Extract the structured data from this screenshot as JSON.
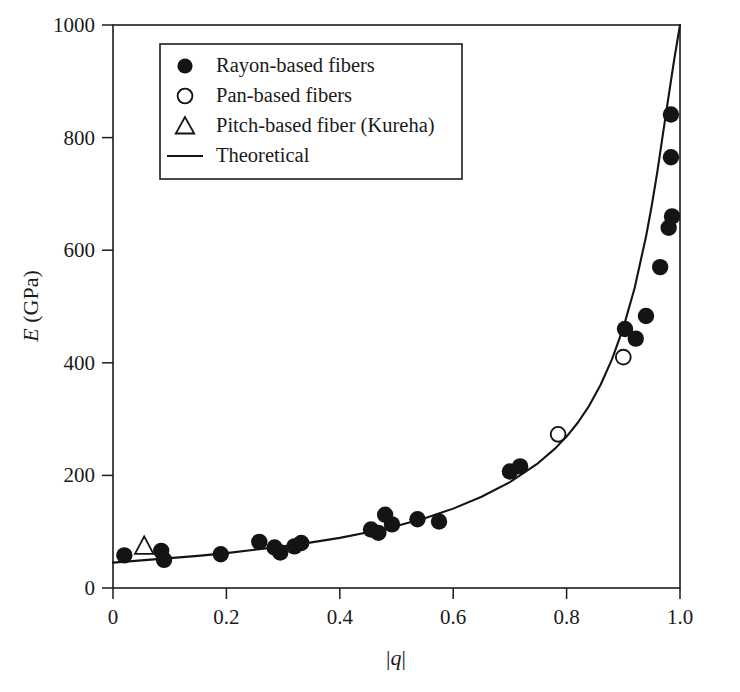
{
  "chart_data": {
    "type": "scatter",
    "title": "",
    "xlabel": "|q|",
    "ylabel": "E (GPa)",
    "xlim": [
      0,
      1.0
    ],
    "ylim": [
      0,
      1000
    ],
    "xticks": [
      0,
      0.2,
      0.4,
      0.6,
      0.8,
      1.0
    ],
    "xticklabels": [
      "0",
      "0.2",
      "0.4",
      "0.6",
      "0.8",
      "1.0"
    ],
    "yticks": [
      0,
      200,
      400,
      600,
      800,
      1000
    ],
    "yticklabels": [
      "0",
      "200",
      "400",
      "600",
      "800",
      "1000"
    ],
    "grid": false,
    "legend_position": "upper-left",
    "series": [
      {
        "name": "Rayon-based fibers",
        "marker": "filled-circle",
        "color": "#141414",
        "points": [
          {
            "x": 0.02,
            "y": 58
          },
          {
            "x": 0.085,
            "y": 66
          },
          {
            "x": 0.09,
            "y": 50
          },
          {
            "x": 0.19,
            "y": 60
          },
          {
            "x": 0.258,
            "y": 82
          },
          {
            "x": 0.285,
            "y": 72
          },
          {
            "x": 0.295,
            "y": 63
          },
          {
            "x": 0.32,
            "y": 74
          },
          {
            "x": 0.332,
            "y": 80
          },
          {
            "x": 0.455,
            "y": 104
          },
          {
            "x": 0.468,
            "y": 98
          },
          {
            "x": 0.48,
            "y": 130
          },
          {
            "x": 0.492,
            "y": 113
          },
          {
            "x": 0.537,
            "y": 122
          },
          {
            "x": 0.575,
            "y": 118
          },
          {
            "x": 0.7,
            "y": 207
          },
          {
            "x": 0.718,
            "y": 216
          },
          {
            "x": 0.903,
            "y": 460
          },
          {
            "x": 0.922,
            "y": 443
          },
          {
            "x": 0.94,
            "y": 483
          },
          {
            "x": 0.965,
            "y": 570
          },
          {
            "x": 0.98,
            "y": 640
          },
          {
            "x": 0.986,
            "y": 660
          },
          {
            "x": 0.984,
            "y": 765
          },
          {
            "x": 0.984,
            "y": 841
          }
        ]
      },
      {
        "name": "Pan-based fibers",
        "marker": "open-circle",
        "color": "#141414",
        "points": [
          {
            "x": 0.785,
            "y": 273
          },
          {
            "x": 0.9,
            "y": 410
          }
        ]
      },
      {
        "name": "Pitch-based fiber (Kureha)",
        "marker": "open-triangle",
        "color": "#141414",
        "points": [
          {
            "x": 0.055,
            "y": 74
          }
        ]
      },
      {
        "name": "Theoretical",
        "marker": "line",
        "color": "#141414",
        "curve": [
          {
            "x": 0.0,
            "y": 45
          },
          {
            "x": 0.05,
            "y": 49
          },
          {
            "x": 0.1,
            "y": 53
          },
          {
            "x": 0.15,
            "y": 57
          },
          {
            "x": 0.2,
            "y": 62
          },
          {
            "x": 0.25,
            "y": 68
          },
          {
            "x": 0.3,
            "y": 74
          },
          {
            "x": 0.35,
            "y": 81
          },
          {
            "x": 0.4,
            "y": 89
          },
          {
            "x": 0.45,
            "y": 99
          },
          {
            "x": 0.5,
            "y": 110
          },
          {
            "x": 0.55,
            "y": 124
          },
          {
            "x": 0.6,
            "y": 141
          },
          {
            "x": 0.65,
            "y": 162
          },
          {
            "x": 0.7,
            "y": 188
          },
          {
            "x": 0.75,
            "y": 222
          },
          {
            "x": 0.78,
            "y": 248
          },
          {
            "x": 0.8,
            "y": 269
          },
          {
            "x": 0.82,
            "y": 294
          },
          {
            "x": 0.84,
            "y": 324
          },
          {
            "x": 0.86,
            "y": 361
          },
          {
            "x": 0.88,
            "y": 406
          },
          {
            "x": 0.9,
            "y": 462
          },
          {
            "x": 0.92,
            "y": 533
          },
          {
            "x": 0.94,
            "y": 624
          },
          {
            "x": 0.95,
            "y": 678
          },
          {
            "x": 0.96,
            "y": 739
          },
          {
            "x": 0.97,
            "y": 807
          },
          {
            "x": 0.98,
            "y": 874
          },
          {
            "x": 0.99,
            "y": 940
          },
          {
            "x": 1.0,
            "y": 1000
          }
        ]
      }
    ]
  },
  "legend": {
    "items": [
      {
        "label": "Rayon-based fibers",
        "marker": "filled-circle"
      },
      {
        "label": "Pan-based fibers",
        "marker": "open-circle"
      },
      {
        "label": "Pitch-based fiber (Kureha)",
        "marker": "open-triangle"
      },
      {
        "label": "Theoretical",
        "marker": "line"
      }
    ]
  },
  "axes": {
    "y_title_italic": "E",
    "y_title_rest": " (GPa)",
    "x_title_bar_left": "|",
    "x_title_italic": "q",
    "x_title_bar_right": "|"
  }
}
